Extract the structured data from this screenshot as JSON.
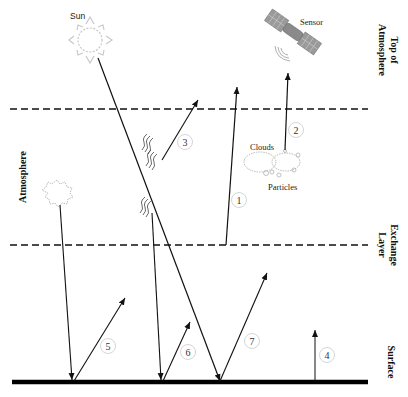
{
  "diagram": {
    "labels": {
      "sun": "Sun",
      "sensor": "Sensor",
      "clouds": "Clouds",
      "particles": "Particles",
      "top_of_atmosphere_line1": "Top of",
      "top_of_atmosphere_line2": "Atmosphere",
      "atmosphere": "Atmosphere",
      "exchange_layer_line1": "Exchange",
      "exchange_layer_line2": "Layer",
      "surface": "Surface"
    },
    "paths": [
      {
        "id": "1",
        "label": "1"
      },
      {
        "id": "2",
        "label": "2"
      },
      {
        "id": "3",
        "label": "3"
      },
      {
        "id": "4",
        "label": "4"
      },
      {
        "id": "5",
        "label": "5"
      },
      {
        "id": "6",
        "label": "6"
      },
      {
        "id": "7",
        "label": "7"
      }
    ],
    "colors": {
      "line": "#111111",
      "sun": "#c8c8c8",
      "satellite": "#8a8a8a",
      "cloud": "#b0b0b0",
      "circle": "#d0d0d0"
    }
  }
}
